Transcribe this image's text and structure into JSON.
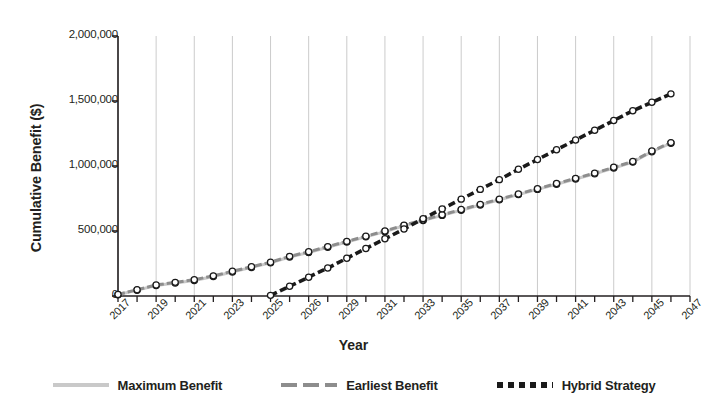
{
  "chart_data": {
    "type": "line",
    "title": "",
    "xlabel": "Year",
    "ylabel": "Cumulative Benefit ($)",
    "xlim": [
      2017,
      2047
    ],
    "ylim": [
      0,
      2000000
    ],
    "grid": "vertical-only",
    "legend_position": "bottom",
    "ytick_labels": [
      "0",
      "500,000",
      "1,000,000",
      "1,500,000",
      "2,000,000"
    ],
    "ytick_values": [
      0,
      500000,
      1000000,
      1500000,
      2000000
    ],
    "xtick_labels": [
      "2017",
      "2019",
      "2021",
      "2023",
      "2025",
      "2026",
      "2029",
      "2031",
      "2033",
      "2035",
      "2037",
      "2039",
      "2041",
      "2043",
      "2045",
      "2047"
    ],
    "xtick_values": [
      2017,
      2019,
      2021,
      2023,
      2025,
      2027,
      2029,
      2031,
      2033,
      2035,
      2037,
      2039,
      2041,
      2043,
      2045,
      2047
    ],
    "series": [
      {
        "name": "Maximum Benefit",
        "color": "#c9c9c9",
        "style": "solid-marker",
        "x": [
          2017,
          2018,
          2019,
          2020,
          2021,
          2022,
          2023,
          2024,
          2025,
          2026,
          2027,
          2028,
          2029,
          2030,
          2031,
          2032,
          2033,
          2034,
          2035,
          2036,
          2037,
          2038,
          2039,
          2040,
          2041,
          2042,
          2043,
          2044,
          2045,
          2046
        ],
        "values": [
          10000,
          45000,
          80000,
          100000,
          120000,
          150000,
          185000,
          220000,
          255000,
          300000,
          335000,
          375000,
          415000,
          455000,
          495000,
          540000,
          580000,
          620000,
          660000,
          700000,
          740000,
          780000,
          820000,
          860000,
          900000,
          940000,
          985000,
          1030000,
          1110000,
          1175000
        ]
      },
      {
        "name": "Earliest Benefit",
        "color": "#8d8d8d",
        "style": "dashed-marker",
        "x": [
          2017,
          2018,
          2019,
          2020,
          2021,
          2022,
          2023,
          2024,
          2025,
          2026,
          2027,
          2028,
          2029,
          2030,
          2031,
          2032,
          2033,
          2034,
          2035,
          2036,
          2037,
          2038,
          2039,
          2040,
          2041,
          2042,
          2043,
          2044,
          2045,
          2046
        ],
        "values": [
          12000,
          48000,
          85000,
          105000,
          125000,
          155000,
          190000,
          225000,
          260000,
          305000,
          340000,
          380000,
          420000,
          460000,
          500000,
          545000,
          585000,
          625000,
          665000,
          705000,
          745000,
          785000,
          825000,
          865000,
          905000,
          945000,
          990000,
          1035000,
          1115000,
          1180000
        ]
      },
      {
        "name": "Hybrid Strategy",
        "color": "#1a1a1a",
        "style": "heavy-dashed-marker",
        "x": [
          2025,
          2026,
          2027,
          2028,
          2029,
          2030,
          2031,
          2032,
          2033,
          2034,
          2035,
          2036,
          2037,
          2038,
          2039,
          2040,
          2041,
          2042,
          2043,
          2044,
          2045,
          2046
        ],
        "values": [
          5000,
          75000,
          145000,
          215000,
          290000,
          365000,
          440000,
          515000,
          595000,
          670000,
          745000,
          820000,
          895000,
          975000,
          1050000,
          1125000,
          1200000,
          1275000,
          1350000,
          1425000,
          1490000,
          1555000
        ]
      }
    ]
  },
  "legend": {
    "items": [
      {
        "label": "Maximum Benefit"
      },
      {
        "label": "Earliest Benefit"
      },
      {
        "label": "Hybrid Strategy"
      }
    ]
  }
}
